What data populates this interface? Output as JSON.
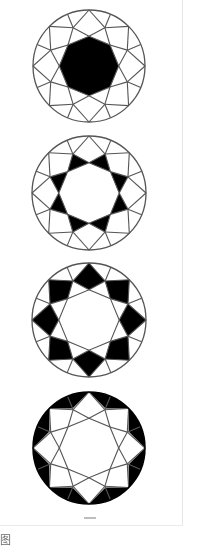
{
  "figure": {
    "stroke_color": "#555555",
    "fill_color": "#000000",
    "background": "#ffffff",
    "diamonds": [
      {
        "id": "table",
        "cx": 89,
        "cy": 66,
        "r": 56,
        "highlight": "table"
      },
      {
        "id": "star-facets",
        "cx": 89,
        "cy": 193,
        "r": 57,
        "highlight": "star"
      },
      {
        "id": "bezel-facets",
        "cx": 89,
        "cy": 320,
        "r": 57,
        "highlight": "kite"
      },
      {
        "id": "upper-girdle-facets",
        "cx": 89,
        "cy": 448,
        "r": 56,
        "highlight": "girdle"
      }
    ],
    "geometry": {
      "table_radius": 0.53,
      "star_point_radius": 0.74
    }
  },
  "caption": {
    "text": "图"
  }
}
